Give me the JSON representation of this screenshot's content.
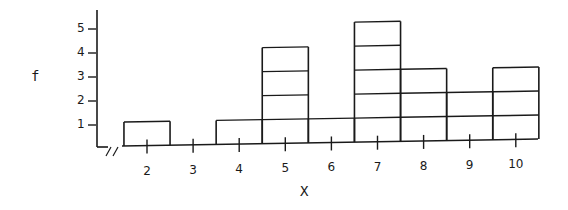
{
  "chart_data": {
    "type": "bar",
    "subtype": "stacked-unit-histogram",
    "title": "",
    "xlabel": "X",
    "ylabel": "f",
    "categories": [
      "2",
      "3",
      "4",
      "5",
      "6",
      "7",
      "8",
      "9",
      "10"
    ],
    "values": [
      1,
      0,
      1,
      4,
      1,
      5,
      3,
      2,
      3
    ],
    "yticks": [
      "1",
      "2",
      "3",
      "4",
      "5"
    ],
    "ylim": [
      0,
      5
    ],
    "axis_break": "//",
    "grid": false,
    "legend": null,
    "bar_style": "outlined unit blocks, adjacent bars"
  },
  "labels": {
    "y_axis": "f",
    "x_axis": "X",
    "yticks": [
      "1",
      "2",
      "3",
      "4",
      "5"
    ],
    "xticks": [
      "2",
      "3",
      "4",
      "5",
      "6",
      "7",
      "8",
      "9",
      "10"
    ]
  },
  "colors": {
    "ink": "#1a1a1a",
    "background": "#ffffff"
  }
}
